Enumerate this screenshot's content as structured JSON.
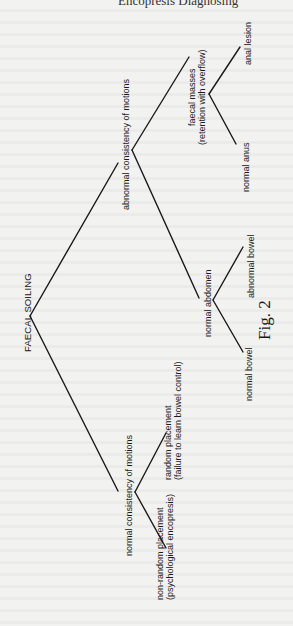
{
  "page": {
    "header_fragment": "Encopresis Diagnosing"
  },
  "diagram": {
    "type": "decision-tree",
    "orientation": "rotated-90-ccw",
    "root": {
      "label": "FAECAL SOILING"
    },
    "nodes": {
      "abnormal_consistency": {
        "label": "abnormal consistency of motions"
      },
      "normal_consistency": {
        "label": "normal consistency of motions"
      },
      "faecal_masses": {
        "line1": "faecal masses",
        "line2": "(retention with overflow)"
      },
      "normal_abdomen": {
        "label": "normal abdomen"
      },
      "anal_lesion": {
        "label": "anal lesion"
      },
      "normal_anus": {
        "label": "normal anus"
      },
      "abnormal_bowel": {
        "label": "abnormal bowel"
      },
      "normal_bowel": {
        "label": "normal bowel"
      },
      "random_placement": {
        "line1": "random placement",
        "line2": "(failure to learn bowel control)"
      },
      "non_random_placement": {
        "line1": "non-random placement",
        "line2": "(psychological encopresis)"
      }
    },
    "edges": [
      [
        "FAECAL SOILING",
        "abnormal consistency of motions"
      ],
      [
        "FAECAL SOILING",
        "normal consistency of motions"
      ],
      [
        "abnormal consistency of motions",
        "faecal masses"
      ],
      [
        "abnormal consistency of motions",
        "normal abdomen"
      ],
      [
        "faecal masses",
        "anal lesion"
      ],
      [
        "faecal masses",
        "normal anus"
      ],
      [
        "normal abdomen",
        "abnormal bowel"
      ],
      [
        "normal abdomen",
        "normal bowel"
      ],
      [
        "normal consistency of motions",
        "random placement"
      ],
      [
        "normal consistency of motions",
        "non-random placement"
      ]
    ],
    "caption": "Fig. 2"
  }
}
